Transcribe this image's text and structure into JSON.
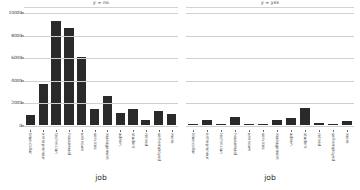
{
  "chart_data": {
    "type": "bar",
    "title": "",
    "xlabel": "job",
    "ylabel": "",
    "ylim": [
      0,
      10000
    ],
    "grid": true,
    "legend": "none",
    "facet_variable": "y",
    "yticks": [
      "0",
      "2000",
      "4000",
      "6000",
      "8000",
      "10000"
    ],
    "ytick_values": [
      0,
      2000,
      4000,
      6000,
      8000,
      10000
    ],
    "panels": [
      {
        "title": "y = no",
        "xlabel": "job",
        "categories": [
          "blue-collar",
          "entrepreneur",
          "technician",
          "housemaid",
          "unknown",
          "services",
          "management",
          "admin.",
          "student",
          "retired",
          "self-employed",
          "more"
        ],
        "values": [
          900,
          3600,
          9200,
          8600,
          6000,
          1400,
          2600,
          1100,
          1400,
          400,
          1200,
          1000
        ]
      },
      {
        "title": "y = yes",
        "xlabel": "job",
        "categories": [
          "blue-collar",
          "entrepreneur",
          "technician",
          "housemaid",
          "unknown",
          "services",
          "management",
          "admin.",
          "student",
          "retired",
          "self-employed",
          "more"
        ],
        "values": [
          120,
          480,
          60,
          700,
          60,
          40,
          420,
          580,
          1500,
          200,
          80,
          330
        ]
      }
    ]
  },
  "axis": {
    "x_title_left": "job",
    "x_title_right": "job"
  }
}
